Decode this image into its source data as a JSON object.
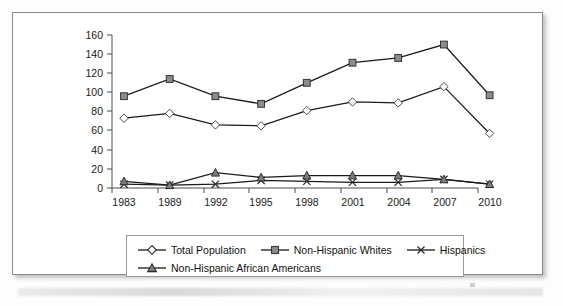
{
  "chart_data": {
    "type": "line",
    "title": "",
    "xlabel": "",
    "ylabel": "",
    "categories": [
      "1983",
      "1989",
      "1992",
      "1995",
      "1998",
      "2001",
      "2004",
      "2007",
      "2010"
    ],
    "ylim": [
      0,
      160
    ],
    "y_ticks": [
      0,
      20,
      40,
      60,
      80,
      100,
      120,
      140,
      160
    ],
    "grid": false,
    "legend_position": "bottom",
    "series": [
      {
        "name": "Total Population",
        "marker": "diamond",
        "values": [
          73,
          78,
          66,
          65,
          81,
          90,
          89,
          106,
          57
        ]
      },
      {
        "name": "Non-Hispanic Whites",
        "marker": "square",
        "values": [
          96,
          114,
          96,
          88,
          110,
          131,
          136,
          150,
          97
        ]
      },
      {
        "name": "Hispanics",
        "marker": "cross",
        "values": [
          4,
          3,
          4,
          8,
          7,
          6,
          6,
          9,
          4
        ]
      },
      {
        "name": "Non-Hispanic African Americans",
        "marker": "triangle",
        "values": [
          7,
          3,
          16,
          11,
          13,
          13,
          13,
          9,
          4
        ]
      }
    ]
  },
  "legend": {
    "items": [
      {
        "label": "Total Population",
        "marker": "diamond"
      },
      {
        "label": "Non-Hispanic Whites",
        "marker": "square"
      },
      {
        "label": "Hispanics",
        "marker": "cross"
      },
      {
        "label": "Non-Hispanic African Americans",
        "marker": "triangle"
      }
    ]
  },
  "axis": {
    "y_ticks": [
      "160",
      "140",
      "120",
      "100",
      "80",
      "60",
      "40",
      "20",
      "0"
    ],
    "x_ticks": [
      "1983",
      "1989",
      "1992",
      "1995",
      "1998",
      "2001",
      "2004",
      "2007",
      "2010"
    ]
  }
}
